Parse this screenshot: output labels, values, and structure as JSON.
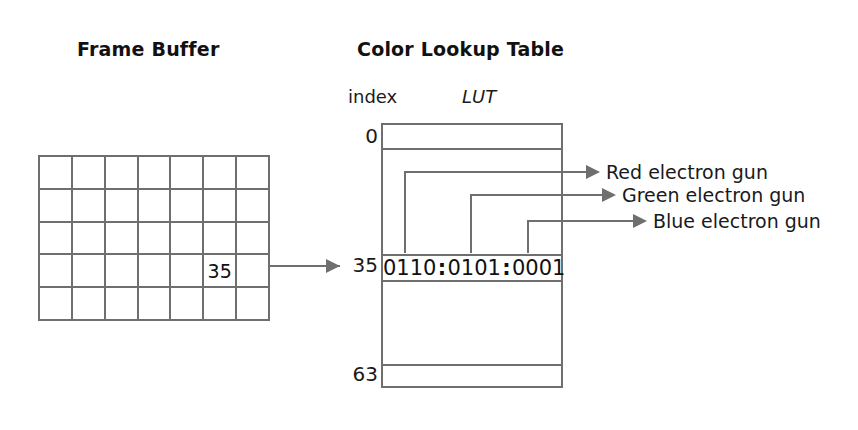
{
  "diagram": {
    "frame_buffer": {
      "title": "Frame Buffer",
      "columns": 7,
      "rows": 5,
      "highlighted_cell": {
        "row": 4,
        "col": 6,
        "value": "35"
      }
    },
    "color_lookup_table": {
      "title": "Color Lookup Table",
      "index_caption": "index",
      "lut_caption": "LUT",
      "index_min_label": "0",
      "index_selected_label": "35",
      "index_max_label": "63",
      "entry_bits": {
        "red": "0110",
        "green": "0101",
        "blue": "0001",
        "separator": ":"
      }
    },
    "outputs": [
      {
        "name": "red-electron-gun",
        "label": "Red electron gun"
      },
      {
        "name": "green-electron-gun",
        "label": "Green electron gun"
      },
      {
        "name": "blue-electron-gun",
        "label": "Blue electron gun"
      }
    ],
    "colors": {
      "line": "#6f6f6f",
      "text": "#1a1a1a",
      "background": "#ffffff"
    }
  }
}
